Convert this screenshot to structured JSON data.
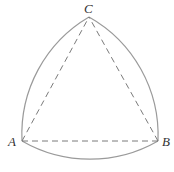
{
  "diagram": {
    "type": "reuleaux-triangle",
    "labels": {
      "a": "A",
      "b": "B",
      "c": "C"
    },
    "colors": {
      "arc": "#9a9a9a",
      "dashed": "#7a7a7a",
      "label": "#333333",
      "background": "#ffffff"
    }
  }
}
